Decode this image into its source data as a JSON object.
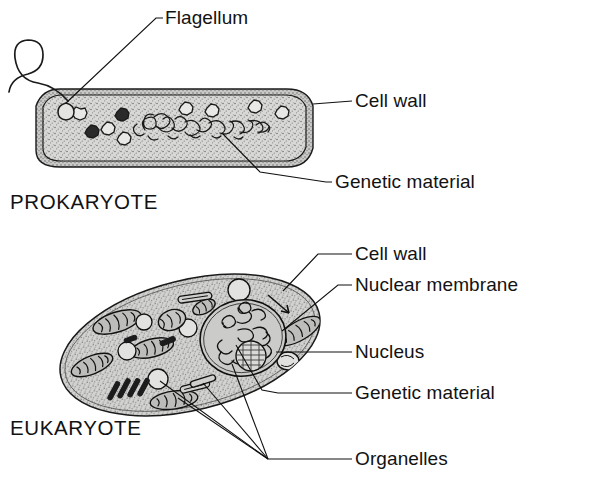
{
  "figure": {
    "background_color": "#ffffff",
    "ink_color": "#111111",
    "cytoplasm_fill": "#d4d4d2",
    "width": 589,
    "height": 489
  },
  "prokaryote": {
    "caption": "PROKARYOTE",
    "labels": {
      "flagellum": "Flagellum",
      "cell_wall": "Cell wall",
      "genetic_material": "Genetic material"
    },
    "features": {
      "flagellum_count": 1,
      "ribosome_count": 8,
      "nucleoid": "tangled DNA strand"
    }
  },
  "eukaryote": {
    "caption": "EUKARYOTE",
    "labels": {
      "cell_wall": "Cell wall",
      "nuclear_membrane": "Nuclear membrane",
      "nucleus": "Nucleus",
      "genetic_material": "Genetic material",
      "organelles": "Organelles"
    },
    "features": {
      "mitochondria_count": 6,
      "vesicle_count": 5,
      "nucleolus": "present",
      "chromatin": "present",
      "organelle_leader_lines": 4
    }
  }
}
